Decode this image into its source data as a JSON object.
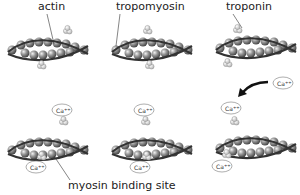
{
  "labels": {
    "actin": "actin",
    "tropomyosin": "tropomyosin",
    "troponin": "troponin",
    "binding_site": "myosin binding site"
  },
  "calcium": {
    "ion": "Ca",
    "charge": "++"
  },
  "colors": {
    "strand": "#333333",
    "bead": "#8a8a8a",
    "troponin": "#d8d8d8"
  }
}
